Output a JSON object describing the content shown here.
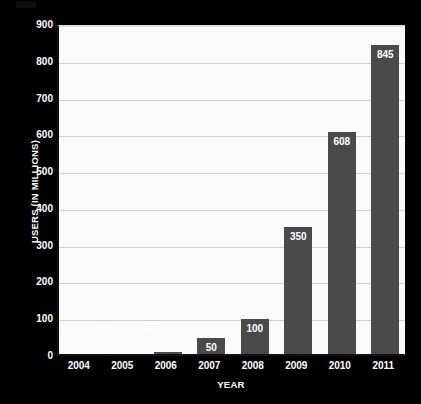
{
  "chart_data": {
    "type": "bar",
    "title": "",
    "xlabel": "YEAR",
    "ylabel": "USERS (IN MILLIONS)",
    "categories": [
      "2004",
      "2005",
      "2006",
      "2007",
      "2008",
      "2009",
      "2010",
      "2011"
    ],
    "values": [
      1,
      5.5,
      12,
      50,
      100,
      350,
      608,
      845
    ],
    "value_labels": [
      "1",
      "5.5",
      "12",
      "50",
      "100",
      "350",
      "608",
      "845"
    ],
    "label_placement": [
      "callout",
      "callout",
      "callout",
      "inside",
      "inside",
      "inside",
      "inside",
      "inside"
    ],
    "ylim": [
      0,
      900
    ],
    "ytick_values": [
      0,
      100,
      200,
      300,
      400,
      500,
      600,
      700,
      800,
      900
    ],
    "ytick_labels": [
      "0",
      "100",
      "200",
      "300",
      "400",
      "500",
      "600",
      "700",
      "800",
      "900"
    ],
    "grid": true,
    "legend": false,
    "legend_position": "none",
    "series": [
      {
        "name": "Users (in millions)",
        "values": [
          1,
          5.5,
          12,
          50,
          100,
          350,
          608,
          845
        ]
      }
    ]
  },
  "style": {
    "background_color": "#000000",
    "plot_background_color": "#fbfbfb",
    "bar_color": "#4a4a4a",
    "gridline_color": "#cfcfcf",
    "axis_color": "#111111",
    "text_color": "#ffffff",
    "value_label_color": "#ffffff"
  }
}
